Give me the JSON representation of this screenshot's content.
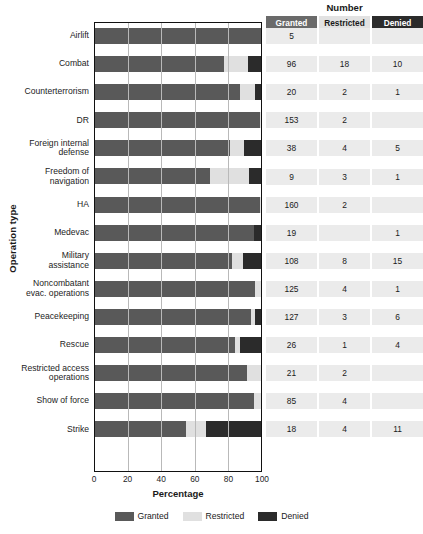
{
  "chart_data": {
    "type": "bar",
    "subtype": "100% stacked horizontal bar",
    "title": "",
    "xlabel": "Percentage",
    "ylabel": "Operation type",
    "xlim": [
      0,
      100
    ],
    "xticks": [
      0,
      20,
      40,
      60,
      80,
      100
    ],
    "grid": true,
    "legend_position": "bottom-center",
    "categories": [
      "Airlift",
      "Combat",
      "Counterterrorism",
      "DR",
      "Foreign internal defense",
      "Freedom of navigation",
      "HA",
      "Medevac",
      "Military assistance",
      "Noncombatant evac. operations",
      "Peacekeeping",
      "Rescue",
      "Restricted access operations",
      "Show of force",
      "Strike"
    ],
    "series": [
      {
        "name": "Granted",
        "color": "#595959",
        "values": [
          100.0,
          77.4,
          87.0,
          98.7,
          80.9,
          69.2,
          98.8,
          95.0,
          82.4,
          96.2,
          93.4,
          83.9,
          91.3,
          95.5,
          54.5
        ]
      },
      {
        "name": "Restricted",
        "color": "#e0e0e0",
        "values": [
          0.0,
          14.5,
          8.7,
          1.3,
          8.5,
          23.1,
          1.2,
          0.0,
          6.1,
          3.1,
          2.2,
          3.2,
          8.7,
          4.5,
          12.1
        ]
      },
      {
        "name": "Denied",
        "color": "#2b2b2b",
        "values": [
          0.0,
          8.1,
          4.3,
          0.0,
          10.6,
          7.7,
          0.0,
          5.0,
          11.5,
          0.8,
          4.4,
          12.9,
          0.0,
          0.0,
          33.3
        ]
      }
    ],
    "counts": {
      "columns": [
        "Granted",
        "Restricted",
        "Denied"
      ],
      "rows": [
        {
          "category": "Airlift",
          "granted": "5",
          "restricted": "",
          "denied": ""
        },
        {
          "category": "Combat",
          "granted": "96",
          "restricted": "18",
          "denied": "10"
        },
        {
          "category": "Counterterrorism",
          "granted": "20",
          "restricted": "2",
          "denied": "1"
        },
        {
          "category": "DR",
          "granted": "153",
          "restricted": "2",
          "denied": ""
        },
        {
          "category": "Foreign internal defense",
          "granted": "38",
          "restricted": "4",
          "denied": "5"
        },
        {
          "category": "Freedom of navigation",
          "granted": "9",
          "restricted": "3",
          "denied": "1"
        },
        {
          "category": "HA",
          "granted": "160",
          "restricted": "2",
          "denied": ""
        },
        {
          "category": "Medevac",
          "granted": "19",
          "restricted": "",
          "denied": "1"
        },
        {
          "category": "Military assistance",
          "granted": "108",
          "restricted": "8",
          "denied": "15"
        },
        {
          "category": "Noncombatant evac. operations",
          "granted": "125",
          "restricted": "4",
          "denied": "1"
        },
        {
          "category": "Peacekeeping",
          "granted": "127",
          "restricted": "3",
          "denied": "6"
        },
        {
          "category": "Rescue",
          "granted": "26",
          "restricted": "1",
          "denied": "4"
        },
        {
          "category": "Restricted access operations",
          "granted": "21",
          "restricted": "2",
          "denied": ""
        },
        {
          "category": "Show of force",
          "granted": "85",
          "restricted": "4",
          "denied": ""
        },
        {
          "category": "Strike",
          "granted": "18",
          "restricted": "4",
          "denied": "11"
        }
      ]
    }
  },
  "axes": {
    "ylabel": "Operation type",
    "xlabel": "Percentage",
    "xticks": [
      "0",
      "20",
      "40",
      "60",
      "80",
      "100"
    ]
  },
  "category_labels": [
    [
      "Airlift"
    ],
    [
      "Combat"
    ],
    [
      "Counterterrorism"
    ],
    [
      "DR"
    ],
    [
      "Foreign internal",
      "defense"
    ],
    [
      "Freedom of",
      "navigation"
    ],
    [
      "HA"
    ],
    [
      "Medevac"
    ],
    [
      "Military",
      "assistance"
    ],
    [
      "Noncombatant",
      "evac. operations"
    ],
    [
      "Peacekeeping"
    ],
    [
      "Rescue"
    ],
    [
      "Restricted access",
      "operations"
    ],
    [
      "Show of force"
    ],
    [
      "Strike"
    ]
  ],
  "table": {
    "title": "Number",
    "headers": [
      "Granted",
      "Restricted",
      "Denied"
    ]
  },
  "legend": {
    "items": [
      {
        "label": "Granted",
        "color": "#595959"
      },
      {
        "label": "Restricted",
        "color": "#e0e0e0"
      },
      {
        "label": "Denied",
        "color": "#2b2b2b"
      }
    ]
  },
  "colors": {
    "granted": "#595959",
    "restricted": "#e0e0e0",
    "denied": "#2b2b2b",
    "header_granted_bg": "#6a6a6a",
    "header_restricted_bg": "#e2e2e2",
    "header_denied_bg": "#2b2b2b",
    "cell_bg": "#ebebeb",
    "axis": "#111111",
    "grid": "#b9b9b9"
  }
}
